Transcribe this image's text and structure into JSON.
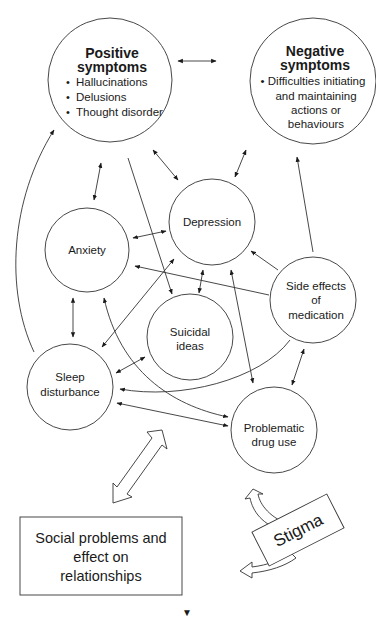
{
  "diagram": {
    "nodes": {
      "positive": {
        "title1": "Positive",
        "title2": "symptoms",
        "bullets": [
          "Hallucinations",
          "Delusions",
          "Thought disorder"
        ]
      },
      "negative": {
        "title1": "Negative",
        "title2": "symptoms",
        "lines": [
          "• Difficulties initiating",
          "and maintaining",
          "actions or",
          "behaviours"
        ]
      },
      "anxiety": {
        "label": "Anxiety"
      },
      "depression": {
        "label": "Depression"
      },
      "side_effects": {
        "lines": [
          "Side effects",
          "of",
          "medication"
        ]
      },
      "suicidal": {
        "lines": [
          "Suicidal",
          "ideas"
        ]
      },
      "sleep": {
        "lines": [
          "Sleep",
          "disturbance"
        ]
      },
      "drug_use": {
        "lines": [
          "Problematic",
          "drug use"
        ]
      },
      "social": {
        "lines": [
          "Social problems and",
          "effect on",
          "relationships"
        ]
      },
      "stigma": {
        "label": "Stigma"
      }
    },
    "edges": [
      {
        "from": "positive",
        "to": "negative",
        "type": "bidirectional"
      },
      {
        "from": "positive",
        "to": "anxiety",
        "type": "bidirectional"
      },
      {
        "from": "positive",
        "to": "depression",
        "type": "bidirectional"
      },
      {
        "from": "positive",
        "to": "suicidal",
        "type": "directed"
      },
      {
        "from": "negative",
        "to": "depression",
        "type": "bidirectional"
      },
      {
        "from": "side_effects",
        "to": "negative",
        "type": "directed"
      },
      {
        "from": "anxiety",
        "to": "depression",
        "type": "bidirectional"
      },
      {
        "from": "side_effects",
        "to": "anxiety",
        "type": "directed"
      },
      {
        "from": "side_effects",
        "to": "depression",
        "type": "directed"
      },
      {
        "from": "depression",
        "to": "suicidal",
        "type": "bidirectional"
      },
      {
        "from": "drug_use",
        "to": "depression",
        "type": "bidirectional"
      },
      {
        "from": "anxiety",
        "to": "sleep",
        "type": "bidirectional"
      },
      {
        "from": "sleep",
        "to": "depression",
        "type": "bidirectional"
      },
      {
        "from": "sleep",
        "to": "suicidal",
        "type": "bidirectional"
      },
      {
        "from": "side_effects",
        "to": "sleep",
        "type": "directed"
      },
      {
        "from": "side_effects",
        "to": "drug_use",
        "type": "bidirectional"
      },
      {
        "from": "sleep",
        "to": "drug_use",
        "type": "bidirectional"
      },
      {
        "from": "anxiety",
        "to": "drug_use",
        "type": "directed"
      },
      {
        "from": "sleep",
        "to": "positive",
        "type": "directed"
      },
      {
        "from": "social",
        "to": "center",
        "type": "block-bidirectional"
      },
      {
        "from": "stigma",
        "to": "drug_use",
        "type": "block-curved"
      },
      {
        "from": "stigma",
        "to": "social",
        "type": "block-curved"
      }
    ],
    "page_marker": "▼"
  }
}
